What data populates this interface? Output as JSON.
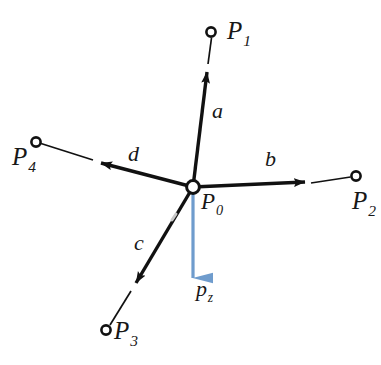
{
  "figure": {
    "type": "vector-force-diagram",
    "background_color": "#ffffff",
    "line_color": "#111111",
    "force_color": "#6f9ccd"
  },
  "nodes": [
    {
      "id": "p0",
      "base": "P",
      "sub": "0",
      "x": 193,
      "y": 187,
      "role": "hub"
    },
    {
      "id": "p1",
      "base": "P",
      "sub": "1",
      "x": 211,
      "y": 32,
      "role": "endpoint"
    },
    {
      "id": "p2",
      "base": "P",
      "sub": "2",
      "x": 356,
      "y": 176,
      "role": "endpoint"
    },
    {
      "id": "p3",
      "base": "P",
      "sub": "3",
      "x": 106,
      "y": 330,
      "role": "endpoint"
    },
    {
      "id": "p4",
      "base": "P",
      "sub": "4",
      "x": 36,
      "y": 142,
      "role": "endpoint"
    }
  ],
  "vectors": [
    {
      "id": "a",
      "label": "a",
      "from": "p0",
      "to": "p1",
      "direction": "up",
      "color": "#111111"
    },
    {
      "id": "b",
      "label": "b",
      "from": "p0",
      "to": "p2",
      "direction": "right",
      "color": "#111111"
    },
    {
      "id": "c",
      "label": "c",
      "from": "p0",
      "to": "p3",
      "direction": "down-left",
      "color": "#111111"
    },
    {
      "id": "d",
      "label": "d",
      "from": "p0",
      "to": "p4",
      "direction": "up-left",
      "color": "#111111"
    }
  ],
  "force": {
    "id": "pz",
    "base": "p",
    "sub": "z",
    "direction": "down",
    "color": "#6f9ccd",
    "from": "p0"
  },
  "labels": {
    "p0": "P",
    "p0_sub": "0",
    "p1": "P",
    "p1_sub": "1",
    "p2": "P",
    "p2_sub": "2",
    "p3": "P",
    "p3_sub": "3",
    "p4": "P",
    "p4_sub": "4",
    "a": "a",
    "b": "b",
    "c": "c",
    "d": "d",
    "pz": "p",
    "pz_sub": "z"
  }
}
